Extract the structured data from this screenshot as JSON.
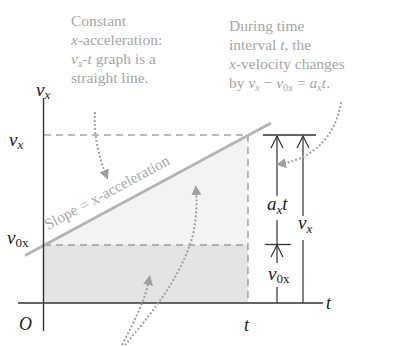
{
  "captions": {
    "left": {
      "lines": [
        "Constant",
        "x-acceleration:",
        "v_x-t graph is a",
        "straight line."
      ],
      "line1": "Constant",
      "line2_var": "x",
      "line2_rest": "-acceleration:",
      "line3_var": "v",
      "line3_sub": "x",
      "line3_var2": "t",
      "line3_rest": " graph is a",
      "line4": "straight line."
    },
    "right": {
      "line1": "During time",
      "line2_a": "interval ",
      "line2_var": "t",
      "line2_b": ", the",
      "line3_var": "x",
      "line3_rest": "-velocity changes",
      "line4_by": "by ",
      "line4_v": "v",
      "line4_v_sub": "x",
      "line4_minus": " − ",
      "line4_v0": "v",
      "line4_v0_sub": "0x",
      "line4_eq": " = ",
      "line4_a": "a",
      "line4_a_sub": "x",
      "line4_t": "t",
      "line4_end": "."
    }
  },
  "axes": {
    "y_label": "v",
    "y_label_sub": "x",
    "x_label": "t",
    "origin_label": "O"
  },
  "ticks": {
    "vx": {
      "main": "v",
      "sub": "x"
    },
    "v0x": {
      "main": "v",
      "sub": "0x"
    },
    "t": "t"
  },
  "slope_label": "Slope = x-acceleration",
  "brackets": {
    "axt": {
      "main": "a",
      "sub": "x",
      "tail": "t"
    },
    "vx": {
      "main": "v",
      "sub": "x"
    },
    "v0x": {
      "main": "v",
      "sub": "0x"
    }
  },
  "colors": {
    "axis": "#333333",
    "slope_line": "#b3b3b3",
    "triangle_fill": "#f3f3f3",
    "rectangle_fill": "#e4e4e4",
    "dashed": "#777777",
    "dotted_arrow": "#a0a0a0",
    "caption_text": "#a6a6a6"
  }
}
